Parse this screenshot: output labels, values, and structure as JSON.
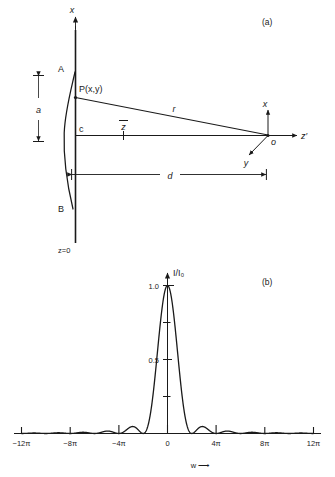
{
  "figure": {
    "panel_a": {
      "tag": "(a)",
      "axis_x_label": "x",
      "axis_zprime_label": "z′",
      "axis_y_label": "y",
      "origin_label": "o",
      "point_a_label": "A",
      "point_b_label": "B",
      "point_c_label": "c",
      "point_p_label": "P(x,y)",
      "ray_label": "r",
      "zbar_label": "z",
      "aperture_height_label": "a",
      "distance_label": "d",
      "plane_label": "z=0"
    },
    "panel_b": {
      "tag": "(b)"
    }
  },
  "chart_data": {
    "type": "line",
    "title": "",
    "xlabel": "w ⟶",
    "ylabel": "I/I₀",
    "xlim": [
      -12.566370614,
      12.566370614
    ],
    "ylim": [
      0,
      1.05
    ],
    "grid": false,
    "legend": null,
    "x_tick_labels": [
      "−12π",
      "−8π",
      "−4π",
      "0",
      "4π",
      "8π",
      "12π"
    ],
    "x_tick_values": [
      -12.566370614,
      -8.37758041,
      -4.188790205,
      0,
      4.188790205,
      8.37758041,
      12.566370614
    ],
    "y_tick_labels": [
      "0.5",
      "1.0"
    ],
    "y_tick_values": [
      0.5,
      1.0
    ],
    "y_minor_tick_values": [
      0.25,
      0.75
    ],
    "function": "sinc-squared",
    "x": [
      -12.5664,
      -12.1,
      -11.6,
      -11.1,
      -10.6,
      -10.1,
      -9.6,
      -9.1,
      -8.6,
      -8.3776,
      -8.0,
      -7.6,
      -7.2,
      -6.8,
      -6.4,
      -6.0,
      -5.6,
      -5.2,
      -4.8,
      -4.4,
      -4.1888,
      -3.8,
      -3.4,
      -3.0,
      -2.6,
      -2.2,
      -1.8,
      -1.4,
      -1.0,
      -0.6,
      -0.2,
      0,
      0.2,
      0.6,
      1.0,
      1.4,
      1.8,
      2.2,
      2.6,
      3.0,
      3.4,
      3.8,
      4.1888,
      4.4,
      4.8,
      5.2,
      5.6,
      6.0,
      6.4,
      6.8,
      7.2,
      7.6,
      8.0,
      8.3776,
      8.6,
      9.1,
      9.6,
      10.1,
      10.6,
      11.1,
      11.6,
      12.1,
      12.5664
    ],
    "y": [
      0.0,
      0.0016,
      0.0043,
      0.0062,
      0.0065,
      0.0052,
      0.0029,
      0.0008,
      0.0,
      0.0,
      0.0017,
      0.0059,
      0.0104,
      0.0135,
      0.014,
      0.0117,
      0.0073,
      0.0025,
      0.0001,
      0.0019,
      0.0,
      0.0101,
      0.0456,
      0.1093,
      0.1989,
      0.3074,
      0.4262,
      0.5455,
      0.6558,
      0.7487,
      0.8177,
      1.0,
      0.8177,
      0.7487,
      0.6558,
      0.5455,
      0.4262,
      0.3074,
      0.1989,
      0.1093,
      0.0456,
      0.0101,
      0.0,
      0.0019,
      0.0001,
      0.0025,
      0.0073,
      0.0117,
      0.014,
      0.0135,
      0.0104,
      0.0059,
      0.0017,
      0.0,
      0.0,
      0.0008,
      0.0029,
      0.0052,
      0.0065,
      0.0062,
      0.0043,
      0.0016,
      0.0
    ],
    "peak_value": 1.0,
    "peak_position": 0
  },
  "colors": {
    "ink": "#1a1a1a",
    "background": "#ffffff"
  }
}
